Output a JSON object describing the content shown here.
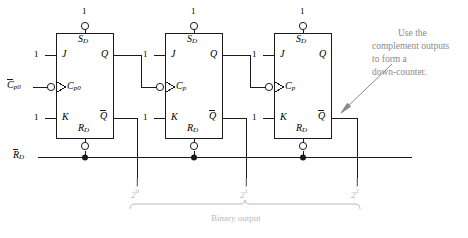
{
  "diagram": {
    "stroke_color": "#1a1a1a",
    "note_color": "#8a8a8a",
    "bus_color": "#b9b9b9"
  },
  "flipflops": [
    {
      "id": "ff0",
      "j_pin_value": "1",
      "j_label": "J",
      "k_pin_value": "1",
      "k_label": "K",
      "clock_label": "C",
      "clock_sub": "p0",
      "set_label": "S",
      "set_sub": "D",
      "set_pin_value": "1",
      "reset_label": "R",
      "reset_sub": "D",
      "q_label": "Q",
      "qbar_label": "Q"
    },
    {
      "id": "ff1",
      "j_pin_value": "1",
      "j_label": "J",
      "k_pin_value": "1",
      "k_label": "K",
      "clock_label": "C",
      "clock_sub": "p",
      "set_label": "S",
      "set_sub": "D",
      "set_pin_value": "1",
      "reset_label": "R",
      "reset_sub": "D",
      "q_label": "Q",
      "qbar_label": "Q"
    },
    {
      "id": "ff2",
      "j_pin_value": "1",
      "j_label": "J",
      "k_pin_value": "1",
      "k_label": "K",
      "clock_label": "C",
      "clock_sub": "p",
      "set_label": "S",
      "set_sub": "D",
      "set_pin_value": "1",
      "reset_label": "R",
      "reset_sub": "D",
      "q_label": "Q",
      "qbar_label": "Q"
    }
  ],
  "inputs": {
    "clock_label": "C",
    "clock_sub": "p0",
    "reset_label": "R",
    "reset_sub": "D"
  },
  "bus": {
    "bit0_base": "2",
    "bit0_exp": "0",
    "bit1_base": "2",
    "bit1_exp": "1",
    "bit2_base": "2",
    "bit2_exp": "2",
    "caption": "Binary output"
  },
  "annotation": {
    "line1": "Use the",
    "line2": "complement outputs",
    "line3": "to form a",
    "line4": "down-counter."
  }
}
